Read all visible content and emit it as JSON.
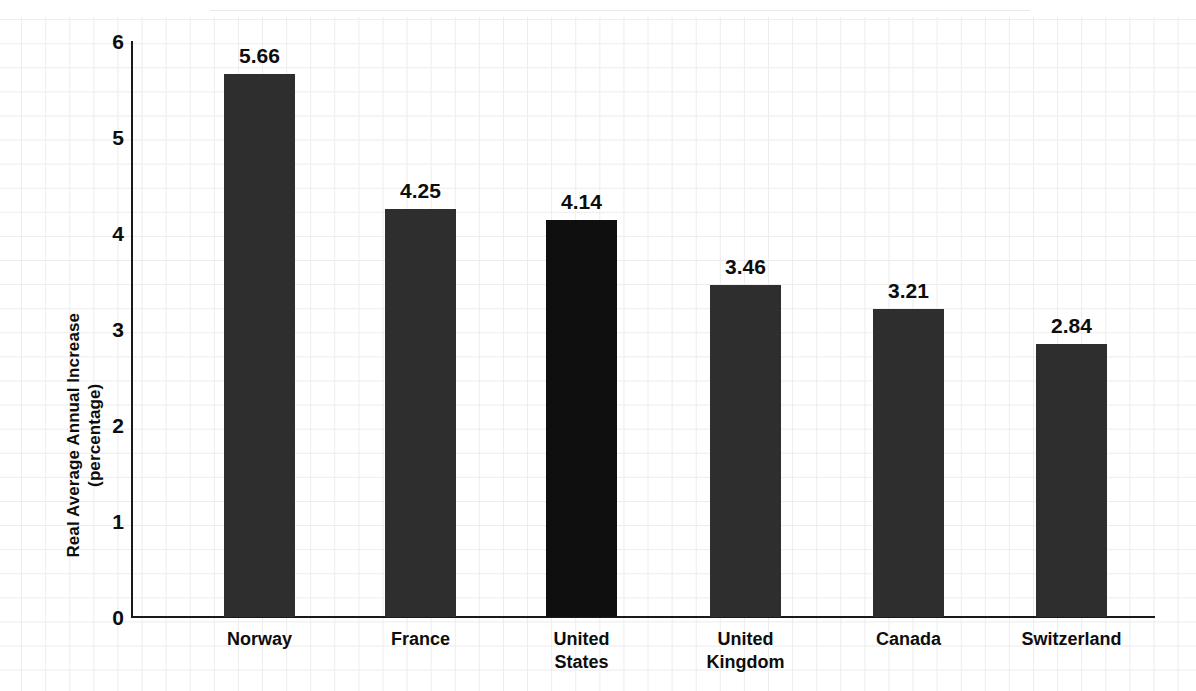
{
  "chart_data": {
    "type": "bar",
    "title": "",
    "subtitle": "",
    "xlabel": "",
    "ylabel": "Real Average Annual Increase (percentage)",
    "ylabel_line1": "Real Average Annual Increase",
    "ylabel_line2": "(percentage)",
    "categories": [
      "Norway",
      "France",
      "United States",
      "United Kingdom",
      "Canada",
      "Switzerland"
    ],
    "category_display": [
      "Norway",
      "France",
      "United\nStates",
      "United\nKingdom",
      "Canada",
      "Switzerland"
    ],
    "values": [
      5.66,
      4.25,
      4.14,
      3.46,
      3.21,
      2.84
    ],
    "value_labels": [
      "5.66",
      "4.25",
      "4.14",
      "3.46",
      "3.21",
      "2.84"
    ],
    "ylim": [
      0,
      6
    ],
    "ytick_labels": [
      "0",
      "1",
      "2",
      "3",
      "4",
      "5",
      "6"
    ],
    "ytick_values": [
      0,
      1,
      2,
      3,
      4,
      5,
      6
    ],
    "grid": false,
    "background_grid_paper": true,
    "legend": null,
    "highlighted_category": "United States",
    "bar_color": "#2e2e2e",
    "bar_color_highlight": "#0f0f0f",
    "axis_color": "#1a1a1a",
    "text_color": "#0d0d0d",
    "paper_grid_color": "#ebebeb",
    "background_color": "#ffffff"
  }
}
